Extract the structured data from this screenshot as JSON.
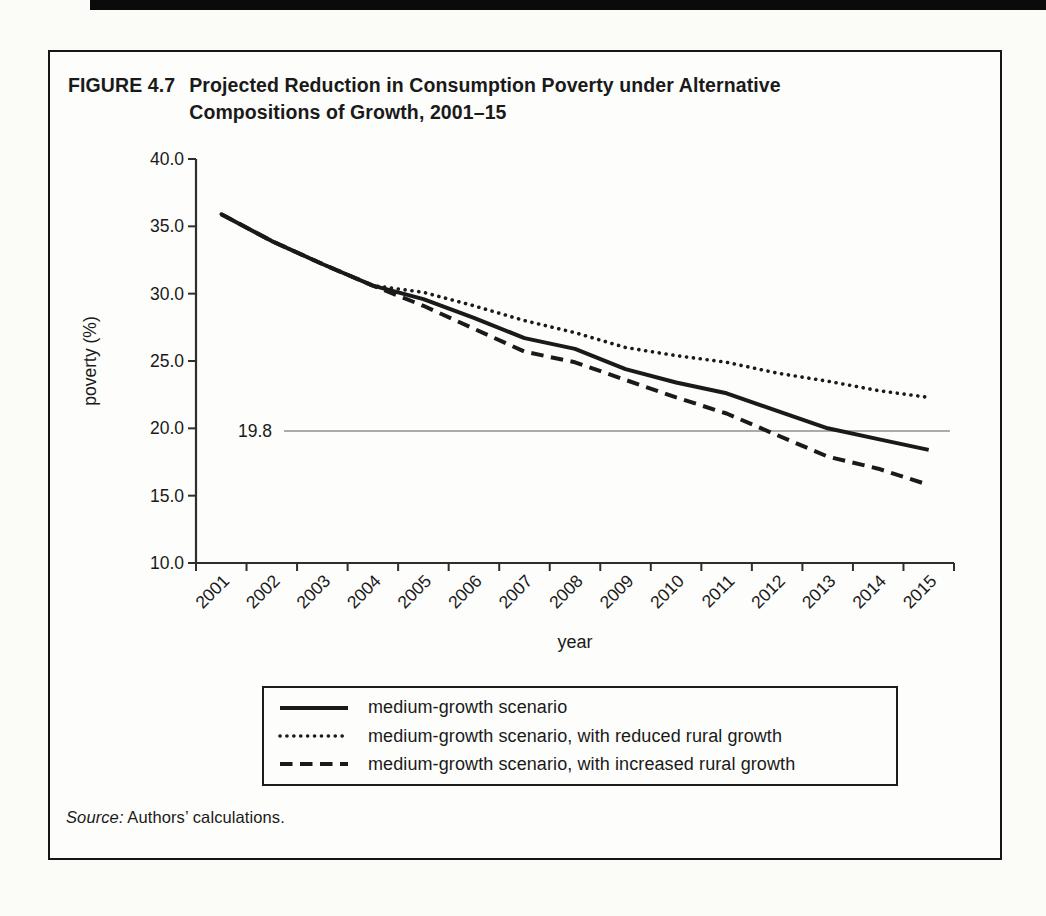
{
  "figure": {
    "label": "FIGURE 4.7",
    "title_line1": "Projected Reduction in Consumption Poverty under Alternative",
    "title_line2": "Compositions of Growth, 2001–15",
    "source_prefix": "Source:",
    "source_text": " Authors’ calculations."
  },
  "chart_data": {
    "type": "line",
    "x": [
      2001,
      2002,
      2003,
      2004,
      2005,
      2006,
      2007,
      2008,
      2009,
      2010,
      2011,
      2012,
      2013,
      2014,
      2015
    ],
    "x_tick_labels": [
      "2001",
      "2002",
      "2003",
      "2004",
      "2005",
      "2006",
      "2007",
      "2008",
      "2009",
      "2010",
      "2011",
      "2012",
      "2013",
      "2014",
      "2015"
    ],
    "xlabel": "year",
    "ylabel": "poverty (%)",
    "ylim": [
      10.0,
      40.0
    ],
    "y_ticks": [
      "40.0",
      "35.0",
      "30.0",
      "25.0",
      "20.0",
      "15.0",
      "10.0"
    ],
    "grid": false,
    "legend_position": "bottom",
    "reference_line": {
      "value": 19.8,
      "label": "19.8"
    },
    "series": [
      {
        "name": "medium-growth scenario",
        "style": "solid",
        "values": [
          35.9,
          33.9,
          32.2,
          30.6,
          29.6,
          28.2,
          26.7,
          25.9,
          24.4,
          23.4,
          22.6,
          21.3,
          20.0,
          19.2,
          18.4
        ]
      },
      {
        "name": "medium-growth scenario, with reduced rural growth",
        "style": "dotted",
        "values": [
          35.9,
          33.9,
          32.2,
          30.6,
          30.1,
          29.1,
          28.0,
          27.1,
          26.0,
          25.4,
          24.9,
          24.1,
          23.5,
          22.8,
          22.3
        ]
      },
      {
        "name": "medium-growth scenario, with increased rural growth",
        "style": "dashed",
        "values": [
          35.9,
          33.9,
          32.2,
          30.6,
          29.1,
          27.4,
          25.7,
          24.9,
          23.6,
          22.3,
          21.1,
          19.5,
          17.9,
          17.0,
          15.8
        ]
      }
    ]
  },
  "colors": {
    "ink": "#1a1a1a",
    "axis": "#2e2e2e",
    "reference_line": "#8f8f8f",
    "paper": "#fdfdfb"
  }
}
